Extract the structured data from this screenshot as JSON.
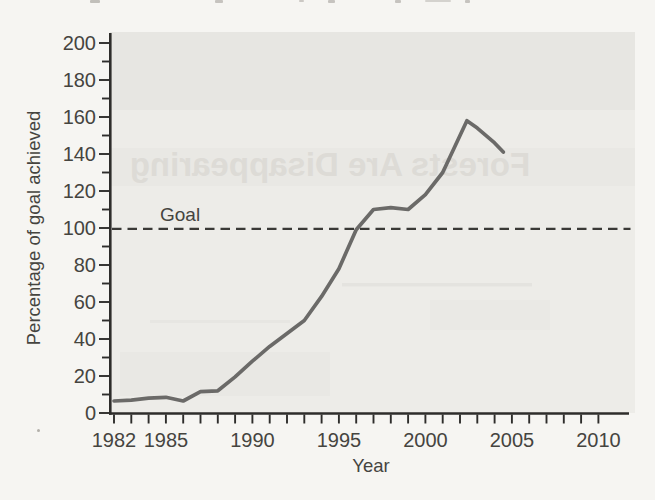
{
  "page": {
    "bleedthrough_text": "Forests Are Disappearing",
    "colors": {
      "page_bg": "#f6f5f2",
      "plot_bg": "#edecE8",
      "axis": "#2e2d2b",
      "label_text": "#45443f",
      "curve": "#6b6a68",
      "goal_line": "#3a3936",
      "bleedthrough": "#dbd9d4"
    }
  },
  "chart_data": {
    "type": "line",
    "title": "",
    "xlabel": "Year",
    "ylabel": "Percentage of goal achieved",
    "goal_annotation": "Goal",
    "goal_value": 100,
    "grid": false,
    "legend": false,
    "x_axis": {
      "min": 1982,
      "max": 2010,
      "minor_tick_step": 1,
      "labeled_ticks": [
        1982,
        1985,
        1990,
        1995,
        2000,
        2005,
        2010
      ]
    },
    "y_axis": {
      "min": 0,
      "max": 200,
      "minor_tick_step": 10,
      "labeled_ticks": [
        0,
        20,
        40,
        60,
        80,
        100,
        120,
        140,
        160,
        180,
        200
      ]
    },
    "series": [
      {
        "name": "percentage-of-goal-achieved",
        "points": [
          [
            1982,
            6.5
          ],
          [
            1983,
            7
          ],
          [
            1984,
            8
          ],
          [
            1985,
            8.5
          ],
          [
            1986,
            6.5
          ],
          [
            1987,
            11.5
          ],
          [
            1988,
            12
          ],
          [
            1989,
            19.5
          ],
          [
            1990,
            28
          ],
          [
            1991,
            36
          ],
          [
            1992,
            43
          ],
          [
            1993,
            50
          ],
          [
            1994,
            63
          ],
          [
            1995,
            78
          ],
          [
            1996,
            99
          ],
          [
            1997,
            110
          ],
          [
            1998,
            111
          ],
          [
            1999,
            110
          ],
          [
            2000,
            118
          ],
          [
            2001,
            130
          ],
          [
            2002,
            150
          ],
          [
            2002.4,
            158
          ],
          [
            2003,
            154
          ],
          [
            2004,
            146
          ],
          [
            2004.5,
            141
          ]
        ]
      }
    ]
  }
}
